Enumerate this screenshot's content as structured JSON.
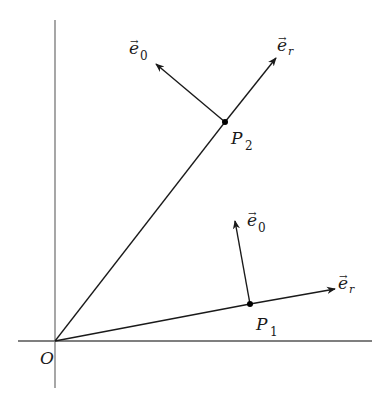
{
  "diagram": {
    "colors": {
      "line": "#1a1a1a",
      "axis": "#555555",
      "background": "#ffffff"
    },
    "origin": {
      "label": "O",
      "x": 55,
      "y": 341
    },
    "axes": {
      "horizontal": {
        "x1": 18,
        "x2": 372,
        "y": 341
      },
      "vertical": {
        "x": 55,
        "y1": 20,
        "y2": 388
      }
    },
    "points": [
      {
        "id": "P1",
        "label": "P",
        "subscript": "1",
        "x": 250,
        "y": 304,
        "radial_line_end": {
          "x": 250,
          "y": 304
        },
        "vectors": [
          {
            "name": "e_r",
            "label": "e",
            "subscript": "r",
            "tip": {
              "x": 335,
              "y": 289
            }
          },
          {
            "name": "e_0",
            "label": "e",
            "subscript": "0",
            "tip": {
              "x": 235,
              "y": 221
            }
          }
        ]
      },
      {
        "id": "P2",
        "label": "P",
        "subscript": "2",
        "x": 225,
        "y": 122,
        "radial_line_end": {
          "x": 225,
          "y": 122
        },
        "vectors": [
          {
            "name": "e_r",
            "label": "e",
            "subscript": "r",
            "tip": {
              "x": 276,
              "y": 58
            }
          },
          {
            "name": "e_0",
            "label": "e",
            "subscript": "0",
            "tip": {
              "x": 156,
              "y": 64
            }
          }
        ]
      }
    ],
    "labels": {
      "origin": "O",
      "p1_main": "P",
      "p1_sub": "1",
      "p2_main": "P",
      "p2_sub": "2",
      "er_main": "e",
      "er_sub": "r",
      "e0_main": "e",
      "e0_sub": "0",
      "vec_arrow": "→"
    }
  }
}
